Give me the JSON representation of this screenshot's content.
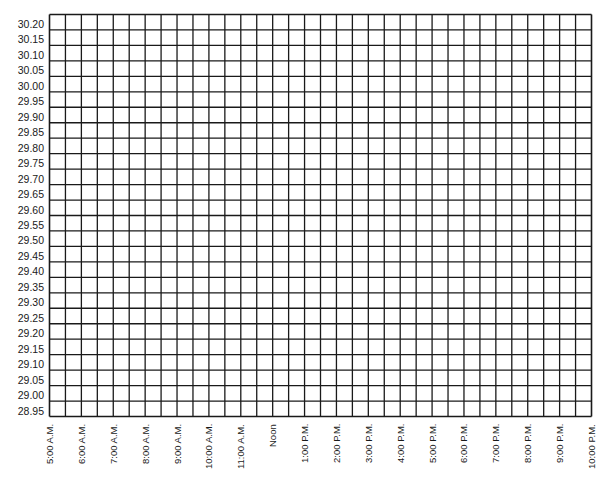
{
  "chart_data": {
    "type": "line",
    "title": "",
    "xlabel": "",
    "ylabel": "",
    "categories": [
      "5:00 A.M.",
      "6:00 A.M.",
      "7:00 A.M.",
      "8:00 A.M.",
      "9:00 A.M.",
      "10:00 A.M.",
      "11:00 A.M.",
      "Noon",
      "1:00 P.M.",
      "2:00 P.M.",
      "3:00 P.M.",
      "4:00 P.M.",
      "5:00 P.M.",
      "6:00 P.M.",
      "7:00 P.M.",
      "8:00 P.M.",
      "9:00 P.M.",
      "10:00 P.M."
    ],
    "y_ticks": [
      "30.20",
      "30.15",
      "30.10",
      "30.05",
      "30.00",
      "29.95",
      "29.90",
      "29.85",
      "29.80",
      "29.75",
      "29.70",
      "29.65",
      "29.60",
      "29.55",
      "29.50",
      "29.45",
      "29.40",
      "29.35",
      "29.30",
      "29.25",
      "29.20",
      "29.15",
      "29.10",
      "29.05",
      "29.00",
      "28.95"
    ],
    "ylim": [
      28.95,
      30.2
    ],
    "series": [],
    "grid": true,
    "grid_columns": 34,
    "grid_rows": 26,
    "legend": null
  },
  "style": {
    "line_color": "#1a1a1a",
    "background": "#ffffff"
  }
}
